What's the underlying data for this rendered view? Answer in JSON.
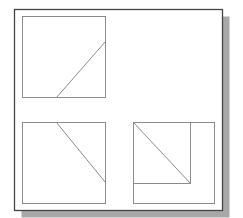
{
  "diagram": {
    "type": "orthographic-projection",
    "colors": {
      "background": "#ffffff",
      "frame_stroke": "#444444",
      "shadow": "#a8a8a8",
      "line_stroke": "#8c8c8c"
    },
    "frame": {
      "x": 14,
      "y": 9,
      "width": 208,
      "height": 201
    },
    "shadow": {
      "x": 21,
      "y": 16,
      "width": 208,
      "height": 201
    },
    "views": [
      {
        "name": "top-view",
        "box": {
          "x": 22,
          "y": 16,
          "width": 83,
          "height": 81
        },
        "lines": [
          {
            "x1": 56,
            "y1": 97,
            "x2": 105,
            "y2": 41
          }
        ]
      },
      {
        "name": "front-view",
        "box": {
          "x": 22,
          "y": 122,
          "width": 83,
          "height": 81
        },
        "lines": [
          {
            "x1": 56,
            "y1": 122,
            "x2": 105,
            "y2": 182
          }
        ]
      },
      {
        "name": "side-view",
        "box": {
          "x": 133,
          "y": 122,
          "width": 81,
          "height": 81
        },
        "inner_box": {
          "x": 133,
          "y": 122,
          "width": 57,
          "height": 61
        },
        "lines": [
          {
            "x1": 133,
            "y1": 122,
            "x2": 190,
            "y2": 183
          }
        ]
      }
    ]
  }
}
